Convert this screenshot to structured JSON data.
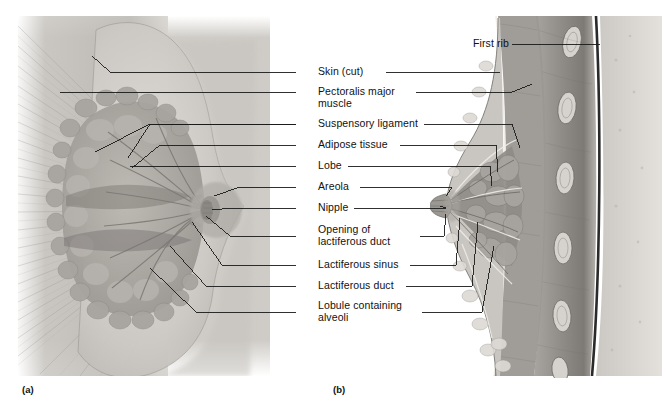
{
  "figure": {
    "title_visible": false,
    "type": "anatomical-illustration",
    "panels": [
      {
        "id": "a",
        "label": "(a)",
        "view": "anterior cutaway view",
        "x": 22,
        "y": 388
      },
      {
        "id": "b",
        "label": "(b)",
        "view": "sagittal section",
        "x": 333,
        "y": 388
      }
    ],
    "colors": {
      "ink": "#111111",
      "leader_line": "#1a1a1a",
      "tissue_light": "#d8d6d2",
      "tissue_mid": "#b4b1ac",
      "tissue_dark": "#8d8a85",
      "tissue_deep": "#6e6b67",
      "pleura_line": "#2a2a2a",
      "background": "#ffffff"
    }
  },
  "labels": [
    {
      "name": "skin-cut",
      "text": "Skin (cut)",
      "text2": "",
      "y": 72,
      "dual": true
    },
    {
      "name": "pectoralis-major",
      "text": "Pectoralis major",
      "text2": "muscle",
      "y": 92,
      "dual": true
    },
    {
      "name": "suspensory-ligament",
      "text": "Suspensory ligament",
      "text2": "",
      "y": 124,
      "dual": true
    },
    {
      "name": "adipose-tissue",
      "text": "Adipose tissue",
      "text2": "",
      "y": 145,
      "dual": true
    },
    {
      "name": "lobe",
      "text": "Lobe",
      "text2": "",
      "y": 166,
      "dual": true
    },
    {
      "name": "areola",
      "text": "Areola",
      "text2": "",
      "y": 187,
      "dual": true
    },
    {
      "name": "nipple",
      "text": "Nipple",
      "text2": "",
      "y": 208,
      "dual": true
    },
    {
      "name": "opening-lactiferous-duct",
      "text": "Opening of",
      "text2": "lactiferous duct",
      "y": 230,
      "dual": true
    },
    {
      "name": "lactiferous-sinus",
      "text": "Lactiferous sinus",
      "text2": "",
      "y": 265,
      "dual": true
    },
    {
      "name": "lactiferous-duct",
      "text": "Lactiferous duct",
      "text2": "",
      "y": 286,
      "dual": true
    },
    {
      "name": "lobule-alveoli",
      "text": "Lobule containing",
      "text2": "alveoli",
      "y": 306,
      "dual": true
    }
  ],
  "first_rib": {
    "name": "first-rib",
    "text": "First rib",
    "x": 473,
    "y": 44
  }
}
